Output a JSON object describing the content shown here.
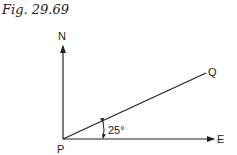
{
  "figure": {
    "caption": "Fig. 29.69",
    "labels": {
      "north": "N",
      "east": "E",
      "origin": "P",
      "point": "Q",
      "angle": "25°"
    },
    "colors": {
      "line": "#222222",
      "background": "#ffffff"
    }
  }
}
